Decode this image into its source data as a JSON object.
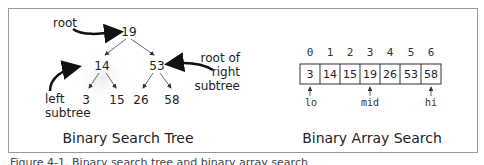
{
  "tree": {
    "title": "Binary Search Tree",
    "nodes": [
      {
        "id": "root",
        "label": "19"
      },
      {
        "id": "left",
        "label": "14"
      },
      {
        "id": "right",
        "label": "53"
      },
      {
        "id": "ll",
        "label": "3"
      },
      {
        "id": "lr",
        "label": "15"
      },
      {
        "id": "rl",
        "label": "26"
      },
      {
        "id": "rr",
        "label": "58"
      }
    ],
    "annotations": {
      "root": "root",
      "left_subtree_line1": "left",
      "left_subtree_line2": "subtree",
      "right_root_line1": "root of",
      "right_root_line2": "right",
      "right_root_line3": "subtree"
    }
  },
  "array": {
    "title": "Binary Array Search",
    "indices": [
      "0",
      "1",
      "2",
      "3",
      "4",
      "5",
      "6"
    ],
    "values": [
      "3",
      "14",
      "15",
      "19",
      "26",
      "53",
      "58"
    ],
    "pointers": {
      "lo": "lo",
      "mid": "mid",
      "hi": "hi"
    }
  },
  "caption": "Figure 4-1. Binary search tree and binary array search"
}
